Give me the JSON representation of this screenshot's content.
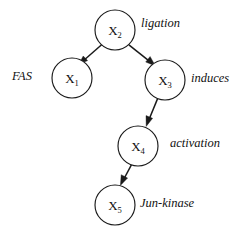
{
  "figure": {
    "type": "directed-graph",
    "background_color": "#ffffff",
    "stroke_color": "#1a1a1a",
    "nodes": [
      {
        "id": "x2",
        "base": "X",
        "subscript": "2",
        "label": "X2",
        "cx": 115,
        "cy": 30,
        "r": 20
      },
      {
        "id": "x1",
        "base": "X",
        "subscript": "1",
        "label": "X1",
        "cx": 72,
        "cy": 78,
        "r": 20
      },
      {
        "id": "x3",
        "base": "X",
        "subscript": "3",
        "label": "X3",
        "cx": 165,
        "cy": 80,
        "r": 20
      },
      {
        "id": "x4",
        "base": "X",
        "subscript": "4",
        "label": "X4",
        "cx": 138,
        "cy": 146,
        "r": 20
      },
      {
        "id": "x5",
        "base": "X",
        "subscript": "5",
        "label": "X5",
        "cx": 115,
        "cy": 205,
        "r": 20
      }
    ],
    "edges": [
      {
        "id": "e-x2-x1",
        "from": "x2",
        "to": "x1",
        "direction": "down-left"
      },
      {
        "id": "e-x2-x3",
        "from": "x2",
        "to": "x3",
        "direction": "down-right"
      },
      {
        "id": "e-x3-x4",
        "from": "x3",
        "to": "x4",
        "direction": "down-left"
      },
      {
        "id": "e-x4-x5",
        "from": "x4",
        "to": "x5",
        "direction": "down-left"
      }
    ],
    "annotations": [
      {
        "id": "fas",
        "text": "FAS",
        "attached_to": "x1",
        "position": "left"
      },
      {
        "id": "ligation",
        "text": "ligation",
        "attached_to": "x2",
        "position": "right"
      },
      {
        "id": "induces",
        "text": "induces",
        "attached_to": "x3",
        "position": "right"
      },
      {
        "id": "activation",
        "text": "activation",
        "attached_to": "x4",
        "position": "right"
      },
      {
        "id": "junkinase",
        "text": "Jun-kinase",
        "attached_to": "x5",
        "position": "right"
      }
    ]
  }
}
